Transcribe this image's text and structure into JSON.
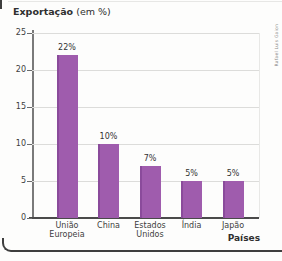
{
  "title": {
    "main": "Exportação",
    "suffix": " (em %)"
  },
  "xlabel": "Países",
  "credit": "Rafael Luis Gaion",
  "colors": {
    "bar": "#9f5cad",
    "bar_edge": "#8a4b9b",
    "grid": "#dcdcda",
    "axis": "#4a4a4a",
    "text": "#3d3d3d"
  },
  "chart_data": {
    "type": "bar",
    "title": "Exportação (em %)",
    "xlabel": "Países",
    "ylabel": "",
    "categories": [
      "União Europeia",
      "China",
      "Estados Unidos",
      "Índia",
      "Japão"
    ],
    "values": [
      22,
      10,
      7,
      5,
      5
    ],
    "value_labels": [
      "22%",
      "10%",
      "7%",
      "5%",
      "5%"
    ],
    "ylim": [
      0,
      25
    ],
    "yticks": [
      0,
      5,
      10,
      15,
      20,
      25
    ],
    "grid": true,
    "legend": "none"
  }
}
